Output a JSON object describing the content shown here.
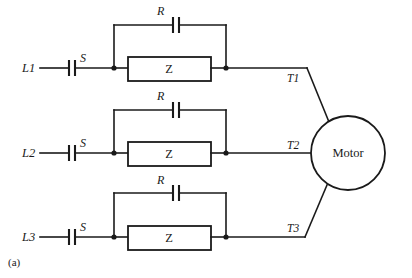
{
  "figure": {
    "caption": "(a)",
    "background_color": "#ffffff",
    "line_color": "#1a1a1a"
  },
  "motor": {
    "label": "Motor",
    "shape": "circle",
    "cx": 348,
    "cy": 153,
    "r": 37
  },
  "phases": [
    {
      "id": "phase-1",
      "supply_label": "L1",
      "switch_label": "S",
      "resistor_label": "R",
      "impedance_label": "Z",
      "terminal_label": "T1",
      "row_y": 68,
      "bypass_rail_y": 25
    },
    {
      "id": "phase-2",
      "supply_label": "L2",
      "switch_label": "S",
      "resistor_label": "R",
      "impedance_label": "Z",
      "terminal_label": "T2",
      "row_y": 153,
      "bypass_rail_y": 110
    },
    {
      "id": "phase-3",
      "supply_label": "L3",
      "switch_label": "S",
      "resistor_label": "R",
      "impedance_label": "Z",
      "terminal_label": "T3",
      "row_y": 237,
      "bypass_rail_y": 193
    }
  ],
  "labels": {
    "l1": "L1",
    "l2": "L2",
    "l3": "L3",
    "s1": "S",
    "s2": "S",
    "s3": "S",
    "r1": "R",
    "r2": "R",
    "r3": "R",
    "z1": "Z",
    "z2": "Z",
    "z3": "Z",
    "t1": "T1",
    "t2": "T2",
    "t3": "T3",
    "motor": "Motor",
    "figure_caption": "(a)"
  }
}
